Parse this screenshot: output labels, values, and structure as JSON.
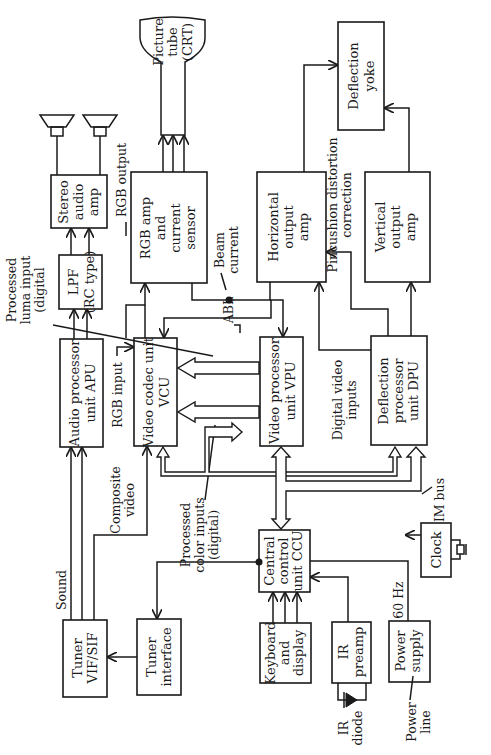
{
  "diagram": {
    "orientation": "rotated 90 degrees counter-clockwise",
    "blocks": {
      "stereo_amp": {
        "lines": [
          "Stereo",
          "audio",
          "amp"
        ]
      },
      "rgb_amp": {
        "lines": [
          "RGB amp",
          "and",
          "current",
          "sensor"
        ]
      },
      "crt": {
        "lines": [
          "Picture",
          "tube",
          "(CRT)"
        ]
      },
      "horiz_amp": {
        "lines": [
          "Horizontal",
          "output",
          "amp"
        ]
      },
      "yoke": {
        "lines": [
          "Deflection",
          "yoke"
        ]
      },
      "vert_amp": {
        "lines": [
          "Vertical",
          "output",
          "amp"
        ]
      },
      "lpf": {
        "lines": [
          "LPF",
          "(RC type)"
        ]
      },
      "apu": {
        "lines": [
          "Audio processor",
          "unit APU"
        ]
      },
      "vcu": {
        "lines": [
          "Video codec unit",
          "VCU"
        ]
      },
      "vpu": {
        "lines": [
          "Video processor",
          "unit VPU"
        ]
      },
      "dpu": {
        "lines": [
          "Deflection",
          "processor",
          "unit DPU"
        ]
      },
      "tuner": {
        "lines": [
          "Tuner",
          "VIF/SIF"
        ]
      },
      "tuner_if": {
        "lines": [
          "Tuner",
          "interface"
        ]
      },
      "ccu": {
        "lines": [
          "Central",
          "control",
          "unit CCU"
        ]
      },
      "keyboard": {
        "lines": [
          "Keyboard",
          "and",
          "display"
        ]
      },
      "ir_preamp": {
        "lines": [
          "IR",
          "preamp"
        ]
      },
      "power": {
        "lines": [
          "Power",
          "supply"
        ]
      },
      "clock": {
        "lines": [
          "Clock"
        ]
      }
    },
    "labels": {
      "rgb_output": "RGB output",
      "beam_current": [
        "Beam",
        "current"
      ],
      "abl": "ABL",
      "pincushion": [
        "Pincushion distortion",
        "correction"
      ],
      "luma": [
        "Processed",
        "luma input",
        "(digital"
      ],
      "rgb_input": "RGB input",
      "composite": [
        "Composite",
        "video"
      ],
      "color_inputs": [
        "Processed",
        "color inputs",
        "(digital)"
      ],
      "digital_video": [
        "Digital video",
        "inputs"
      ],
      "im_bus": "IM bus",
      "sound": "Sound",
      "hz60": "60 Hz",
      "ir_diode": [
        "IR",
        "diode"
      ],
      "power_line": [
        "Power",
        "line"
      ]
    }
  }
}
